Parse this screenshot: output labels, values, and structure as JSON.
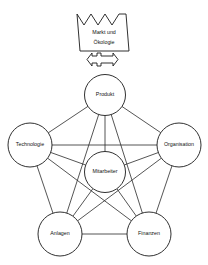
{
  "diagram": {
    "title_shape": {
      "name": "crown",
      "lines": [
        "Markt und",
        "Ökologie"
      ]
    },
    "connector": {
      "name": "double-headed-arrow",
      "direction": "bidirectional"
    },
    "nodes": [
      {
        "id": "produkt",
        "label": "Produkt",
        "cx": 105,
        "cy": 95,
        "r": 20.5
      },
      {
        "id": "technologie",
        "label": "Technologie",
        "cx": 30,
        "cy": 145,
        "r": 22.0
      },
      {
        "id": "organisation",
        "label": "Organisation",
        "cx": 179,
        "cy": 145,
        "r": 22.0
      },
      {
        "id": "mitarbeiter",
        "label": "Mitarbeiter",
        "cx": 105,
        "cy": 172,
        "r": 20.5
      },
      {
        "id": "anlagen",
        "label": "Anlagen",
        "cx": 60,
        "cy": 234,
        "r": 22.0
      },
      {
        "id": "finanzen",
        "label": "Finanzen",
        "cx": 149,
        "cy": 234,
        "r": 22.0
      }
    ],
    "edges": [
      {
        "from": "produkt",
        "to": "technologie"
      },
      {
        "from": "produkt",
        "to": "organisation"
      },
      {
        "from": "produkt",
        "to": "mitarbeiter"
      },
      {
        "from": "produkt",
        "to": "anlagen"
      },
      {
        "from": "produkt",
        "to": "finanzen"
      },
      {
        "from": "technologie",
        "to": "organisation"
      },
      {
        "from": "technologie",
        "to": "mitarbeiter"
      },
      {
        "from": "technologie",
        "to": "anlagen"
      },
      {
        "from": "technologie",
        "to": "finanzen"
      },
      {
        "from": "organisation",
        "to": "mitarbeiter"
      },
      {
        "from": "organisation",
        "to": "anlagen"
      },
      {
        "from": "organisation",
        "to": "finanzen"
      },
      {
        "from": "mitarbeiter",
        "to": "anlagen"
      },
      {
        "from": "mitarbeiter",
        "to": "finanzen"
      },
      {
        "from": "anlagen",
        "to": "finanzen"
      }
    ],
    "colors": {
      "background": "#ffffff",
      "stroke": "#1a1a1a",
      "edge": "#2a2a2a",
      "text": "#111111"
    }
  }
}
